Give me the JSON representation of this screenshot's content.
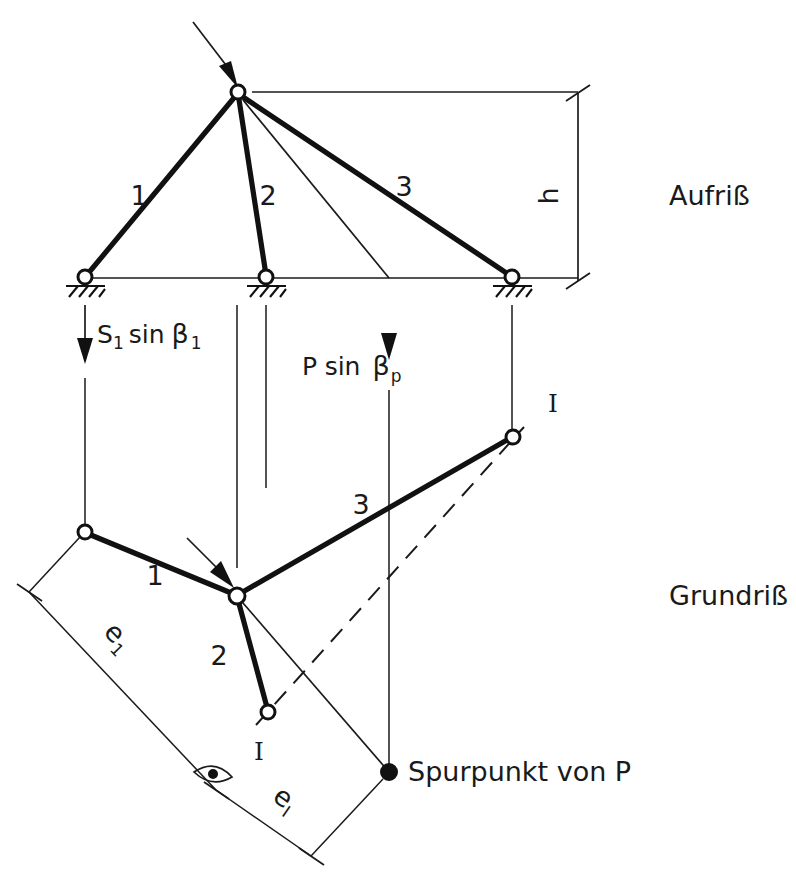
{
  "figure": {
    "title_aufriss": "Aufriß",
    "title_grundriss": "Grundriß",
    "colors": {
      "ink": "#111111",
      "background": "#ffffff"
    }
  },
  "aufriss": {
    "view_label": "Aufriß",
    "member_labels": [
      "1",
      "2",
      "3"
    ],
    "dimension_label": "h",
    "force_left": {
      "base": "S",
      "base_sub": "1",
      "func": "sin",
      "greek": "β",
      "greek_sub": "1",
      "full": "S₁ sin β₁"
    },
    "force_right": {
      "base": "P",
      "func": "sin",
      "greek": "β",
      "greek_sub": "p",
      "full": "P sin βₚ"
    }
  },
  "grundriss": {
    "view_label": "Grundriß",
    "member_labels": [
      "1",
      "2",
      "3"
    ],
    "section_label_top": "I",
    "section_label_bottom": "I",
    "dimension_e1": "e",
    "dimension_e1_sub": "1",
    "dimension_eI": "e",
    "dimension_eI_sub": "I",
    "trace_point_label": "Spurpunkt von P"
  },
  "icons": {
    "pin_support": "pin-support-hatched-icon",
    "hinge_node": "hinge-circle-icon",
    "load_arrow": "load-arrow-icon",
    "view_eye": "viewing-direction-eye-icon",
    "dimension_tick": "dimension-tick-icon",
    "trace_point": "filled-point-icon"
  }
}
